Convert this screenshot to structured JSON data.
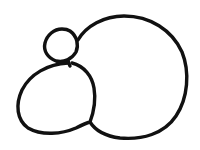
{
  "image": {
    "kind": "line-drawing",
    "title": "Hand-drawn outline figure",
    "description": "Black ink contour drawing of three joined rounded blobs forming a snowman-like or bird-like figure",
    "width": 200,
    "height": 150,
    "background_color": "#ffffff",
    "ink_color": "#111111",
    "stroke_width": 3.4,
    "text_content": "",
    "shapes": [
      {
        "name": "large-right-blob",
        "role": "body-large",
        "bbox": [
          78,
          16,
          186,
          138
        ],
        "path": "M 78 40 C 86 26 104 16 124 16 C 150 16 172 30 182 52 C 190 72 188 98 176 116 C 164 134 142 140 120 138 C 104 136 95 130 90 122"
      },
      {
        "name": "lower-left-blob",
        "role": "body-small",
        "bbox": [
          17,
          62,
          96,
          134
        ],
        "path": "M 68 63 C 48 64 30 74 22 90 C 15 105 17 120 28 128 C 42 136 62 134 76 128 C 86 123 90 122 90 122 C 93 114 96 100 94 88 C 92 76 84 66 72 63"
      },
      {
        "name": "top-small-blob",
        "role": "head",
        "bbox": [
          45,
          28,
          79,
          62
        ],
        "path": "M 62 29 C 54 29 47 35 45 43 C 43 51 48 58 56 61 C 64 63 72 59 76 52 C 79 45 77 36 70 31 C 67 29 64 29 62 29"
      },
      {
        "name": "neck-connector",
        "role": "connector",
        "bbox": [
          66,
          58,
          74,
          66
        ],
        "path": "M 68 60 C 68 62 69 64 70 66"
      }
    ]
  }
}
